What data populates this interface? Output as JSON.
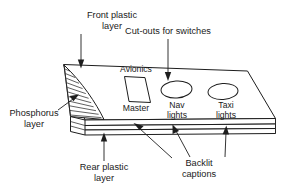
{
  "diagram": {
    "background_color": "#ffffff",
    "line_color": "#1d1d1d",
    "text_color": "#1a1a1a",
    "callouts": [
      {
        "id": "front-plastic-layer",
        "line1": "Front plastic",
        "line2": "layer"
      },
      {
        "id": "cut-outs-for-switches",
        "line1": "Cut-outs for switches",
        "line2": ""
      },
      {
        "id": "phosphorus-layer",
        "line1": "Phosphorus",
        "line2": "layer"
      },
      {
        "id": "rear-plastic-layer",
        "line1": "Rear plastic",
        "line2": "layer"
      },
      {
        "id": "backlit-captions",
        "line1": "Backlit",
        "line2": "captions"
      }
    ],
    "panel_captions": [
      {
        "id": "avionics",
        "text": "Avionics"
      },
      {
        "id": "master",
        "text": "Master"
      },
      {
        "id": "nav-lights",
        "line1": "Nav",
        "line2": "lights"
      },
      {
        "id": "taxi-lights",
        "line1": "Taxi",
        "line2": "lights"
      }
    ],
    "cutouts": [
      {
        "id": "master-cutout",
        "shape": "parallelogram"
      },
      {
        "id": "nav-lights-cutout",
        "shape": "ellipse"
      },
      {
        "id": "taxi-lights-cutout",
        "shape": "ellipse"
      }
    ],
    "hatch_line_count": 12
  }
}
